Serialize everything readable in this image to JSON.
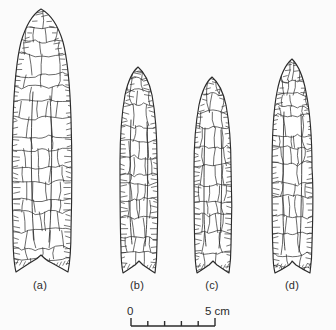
{
  "figure": {
    "kind": "archaeological-line-drawing",
    "background_color": "#fbfbfb",
    "ink_color": "#2b2b2b"
  },
  "specimens": [
    {
      "id": "a",
      "label": "(a)",
      "label_x": 40,
      "label_y": 287,
      "outline": "M 41,9 C 33,14 26,25 21,42 C 16,62 14,90 13,120 C 12,152 12,196 13,232 C 13,252 14,264 16,272 C 22,268 28,264 33,261 C 37,259 39,257 41,255 C 43,257 45,259 48,261 C 54,264 61,268 68,272 C 70,262 71,248 71,230 C 72,194 72,150 71,118 C 70,88 68,61 63,42 C 58,25 50,14 41,9 Z",
      "flutes": [
        "M 33,92 C 31,120 31,160 32,196 C 32,212 33,226 34,240",
        "M 50,96 C 52,124 52,162 51,198 C 51,214 50,228 49,242"
      ]
    },
    {
      "id": "b",
      "label": "(b)",
      "label_x": 137,
      "label_y": 287,
      "outline": "M 138,67 C 132,72 128,81 125,95 C 122,112 120,136 120,162 C 120,192 120,226 121,248 C 121,260 122,268 123,273 C 128,270 132,267 135,265 C 137,263 138,262 139,261 C 140,262 141,263 143,265 C 146,267 150,270 155,273 C 156,266 157,256 157,243 C 158,216 158,186 157,160 C 157,134 155,111 152,95 C 149,81 144,72 138,67 Z",
      "flutes": [
        "M 131,120 C 130,146 130,178 130,206 C 130,222 131,234 132,244",
        "M 147,122 C 148,148 148,180 147,208 C 147,224 146,236 145,246"
      ]
    },
    {
      "id": "c",
      "label": "(c)",
      "label_x": 212,
      "label_y": 287,
      "outline": "M 212,77 C 206,82 202,91 199,105 C 196,121 194,143 194,168 C 194,196 194,228 195,250 C 195,261 196,268 197,273 C 202,270 206,267 209,265 C 211,263 212,262 213,261 C 214,262 215,263 217,265 C 220,267 224,270 229,273 C 230,266 231,257 231,245 C 232,220 232,192 231,167 C 231,143 229,121 226,105 C 223,91 218,82 212,77 Z",
      "flutes": [
        "M 205,128 C 204,152 204,182 204,208 C 204,224 205,236 206,246",
        "M 221,130 C 222,154 222,184 221,210 C 221,226 220,238 219,248"
      ]
    },
    {
      "id": "d",
      "label": "(d)",
      "label_x": 292,
      "label_y": 287,
      "outline": "M 292,59 C 285,65 280,76 277,92 C 273,112 272,140 272,170 C 272,202 272,234 273,252 C 273,262 274,269 275,273 C 281,270 286,267 289,265 C 291,263 292,262 292,261 C 293,262 294,263 296,265 C 299,267 304,270 310,273 C 311,266 312,256 312,243 C 313,214 313,182 312,168 C 312,140 310,112 306,92 C 303,76 298,65 292,59 Z",
      "flutes": [
        "M 284,112 C 283,142 283,178 283,208 C 283,226 284,240 285,250",
        "M 301,114 C 302,144 302,180 301,210 C 301,228 300,242 299,252"
      ]
    }
  ],
  "scale_bar": {
    "min_label": "0",
    "max_label": "5 cm",
    "min_value": 0,
    "max_value": 5,
    "unit": "cm",
    "tick_count": 6,
    "x_start": 131,
    "x_end": 215,
    "bar_y": 326,
    "tick_top": 319,
    "min_label_x": 127,
    "max_label_x": 205,
    "label_y": 313
  }
}
